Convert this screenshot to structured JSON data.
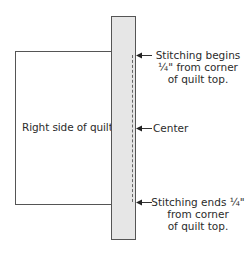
{
  "diagram": {
    "quilt_label": "Right side of quilt",
    "colors": {
      "strip_fill": "#e6e6e6",
      "outline": "#555555",
      "text": "#2b2b2b"
    },
    "annotations": [
      {
        "id": "stitch-begin",
        "lines": [
          "Stitching begins",
          "¼\" from corner",
          "of quilt top."
        ]
      },
      {
        "id": "center",
        "lines": [
          "Center"
        ]
      },
      {
        "id": "stitch-end",
        "lines": [
          "Stitching ends ¼\"",
          "from corner",
          "of quilt top."
        ]
      }
    ]
  }
}
